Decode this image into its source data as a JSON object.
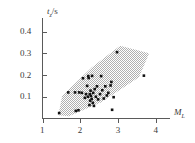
{
  "chart_data": {
    "type": "scatter",
    "title": "",
    "xlabel": "M_L",
    "ylabel": "t_z/s",
    "xlabel_base": "M",
    "xlabel_sub": "L",
    "ylabel_base": "t",
    "ylabel_sub": "z",
    "ylabel_unit": "/s",
    "xlim": [
      1,
      4
    ],
    "ylim": [
      0,
      0.45
    ],
    "xticks": [
      1,
      2,
      3,
      4
    ],
    "xtick_labels": [
      "1",
      "2",
      "3",
      "4"
    ],
    "yticks": [
      0.1,
      0.2,
      0.3,
      0.4
    ],
    "ytick_labels": [
      "0.1",
      "0.2",
      "0.3",
      "0.4"
    ],
    "grid": false,
    "legend": null,
    "marker": "square",
    "marker_color": "#121212",
    "band_color": "#b9b9b9",
    "band_label": "shaded confidence band",
    "band_polygon": [
      [
        1.42,
        0.015
      ],
      [
        1.52,
        0.105
      ],
      [
        2.3,
        0.235
      ],
      [
        3.05,
        0.335
      ],
      [
        3.82,
        0.3
      ],
      [
        3.55,
        0.19
      ],
      [
        2.55,
        0.075
      ],
      [
        1.7,
        0.01
      ]
    ],
    "points": [
      [
        1.44,
        0.025
      ],
      [
        1.68,
        0.12
      ],
      [
        1.86,
        0.12
      ],
      [
        1.88,
        0.035
      ],
      [
        1.95,
        0.038
      ],
      [
        1.97,
        0.12
      ],
      [
        2.04,
        0.118
      ],
      [
        2.07,
        0.185
      ],
      [
        2.12,
        0.095
      ],
      [
        2.15,
        0.112
      ],
      [
        2.18,
        0.15
      ],
      [
        2.2,
        0.1
      ],
      [
        2.21,
        0.195
      ],
      [
        2.22,
        0.186
      ],
      [
        2.24,
        0.062
      ],
      [
        2.25,
        0.112
      ],
      [
        2.26,
        0.082
      ],
      [
        2.27,
        0.128
      ],
      [
        2.28,
        0.104
      ],
      [
        2.3,
        0.09
      ],
      [
        2.31,
        0.196
      ],
      [
        2.33,
        0.072
      ],
      [
        2.34,
        0.118
      ],
      [
        2.36,
        0.058
      ],
      [
        2.38,
        0.135
      ],
      [
        2.41,
        0.1
      ],
      [
        2.44,
        0.148
      ],
      [
        2.47,
        0.088
      ],
      [
        2.52,
        0.112
      ],
      [
        2.55,
        0.195
      ],
      [
        2.58,
        0.13
      ],
      [
        2.62,
        0.092
      ],
      [
        2.66,
        0.148
      ],
      [
        2.7,
        0.106
      ],
      [
        2.74,
        0.118
      ],
      [
        2.8,
        0.152
      ],
      [
        2.82,
        0.168
      ],
      [
        2.84,
        0.04
      ],
      [
        2.88,
        0.098
      ],
      [
        2.97,
        0.305
      ],
      [
        3.68,
        0.197
      ]
    ]
  },
  "figure": {
    "background": "#ffffff",
    "axis_color": "#5a5a5a"
  }
}
